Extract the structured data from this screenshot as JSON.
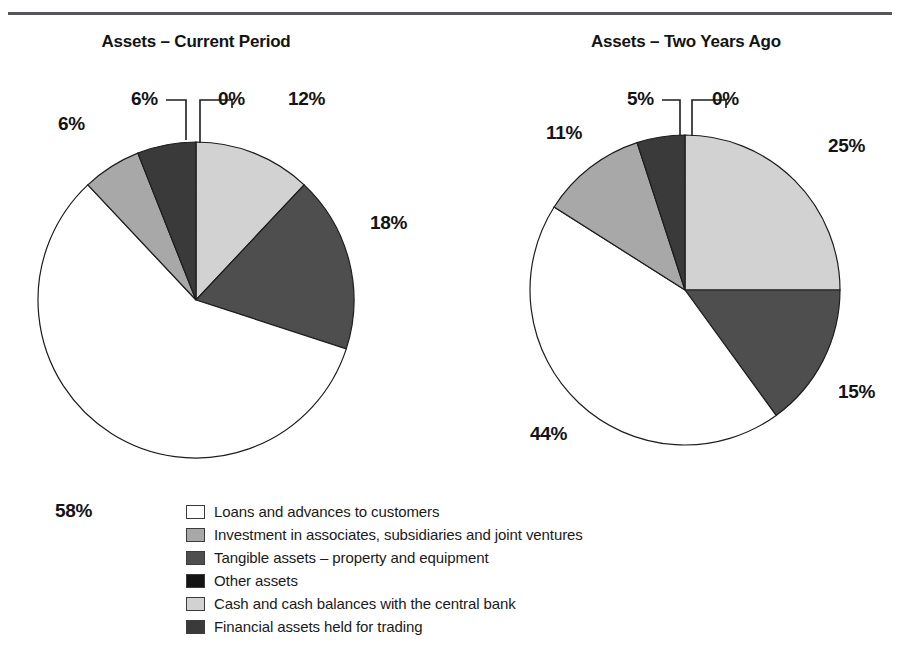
{
  "page": {
    "background_color": "#ffffff",
    "rule_color": "#55565a",
    "text_color": "#141414"
  },
  "chart_data": [
    {
      "type": "pie",
      "title": "Assets – Current Period",
      "labels": [
        "Other assets",
        "Cash and cash balances with the central bank",
        "Tangible assets – property and equipment",
        "Loans and advances to customers",
        "Investment in associates, subsidiaries and joint ventures",
        "Financial assets held for trading"
      ],
      "values": [
        0,
        12,
        18,
        58,
        6,
        6
      ],
      "value_labels": [
        "0%",
        "12%",
        "18%",
        "58%",
        "6%",
        "6%"
      ],
      "colors": [
        "#141414",
        "#d2d2d2",
        "#4e4e4e",
        "#ffffff",
        "#a8a8a8",
        "#3a3a3a"
      ],
      "start_angle_deg": 0,
      "direction": "clockwise",
      "legend_position": "bottom"
    },
    {
      "type": "pie",
      "title": "Assets – Two Years Ago",
      "labels": [
        "Other assets",
        "Cash and cash balances with the central bank",
        "Tangible assets – property and equipment",
        "Loans and advances to customers",
        "Investment in associates, subsidiaries and joint ventures",
        "Financial assets held for trading"
      ],
      "values": [
        0,
        25,
        15,
        44,
        11,
        5
      ],
      "value_labels": [
        "0%",
        "25%",
        "15%",
        "44%",
        "11%",
        "5%"
      ],
      "colors": [
        "#141414",
        "#d2d2d2",
        "#4e4e4e",
        "#ffffff",
        "#a8a8a8",
        "#3a3a3a"
      ],
      "start_angle_deg": 0,
      "direction": "clockwise",
      "legend_position": "bottom"
    }
  ],
  "titles": {
    "left": "Assets – Current Period",
    "right": "Assets – Two Years Ago"
  },
  "pie_left": {
    "cx": 196,
    "cy": 300,
    "r": 158,
    "slices": [
      {
        "name": "other-assets",
        "value": 0,
        "label": "0%",
        "color": "#141414"
      },
      {
        "name": "cash-balances",
        "value": 12,
        "label": "12%",
        "color": "#d2d2d2"
      },
      {
        "name": "tangible-assets",
        "value": 18,
        "label": "18%",
        "color": "#4e4e4e"
      },
      {
        "name": "loans-advances",
        "value": 58,
        "label": "58%",
        "color": "#ffffff"
      },
      {
        "name": "investment-assoc",
        "value": 6,
        "label": "6%",
        "color": "#a8a8a8"
      },
      {
        "name": "financial-assets",
        "value": 6,
        "label": "6%",
        "color": "#3a3a3a"
      }
    ],
    "labels": [
      {
        "name": "slice-label-other-assets",
        "text": "0%",
        "x": 218,
        "y": 88
      },
      {
        "name": "slice-label-cash-balances",
        "text": "12%",
        "x": 288,
        "y": 88
      },
      {
        "name": "slice-label-tangible-assets",
        "text": "18%",
        "x": 370,
        "y": 212
      },
      {
        "name": "slice-label-loans-advances",
        "text": "58%",
        "x": 55,
        "y": 500
      },
      {
        "name": "slice-label-investment-assoc",
        "text": "6%",
        "x": 58,
        "y": 113
      },
      {
        "name": "slice-label-financial-assets",
        "text": "6%",
        "x": 131,
        "y": 88
      }
    ]
  },
  "pie_right": {
    "cx": 685,
    "cy": 290,
    "r": 155,
    "slices": [
      {
        "name": "other-assets",
        "value": 0,
        "label": "0%",
        "color": "#141414"
      },
      {
        "name": "cash-balances",
        "value": 25,
        "label": "25%",
        "color": "#d2d2d2"
      },
      {
        "name": "tangible-assets",
        "value": 15,
        "label": "15%",
        "color": "#4e4e4e"
      },
      {
        "name": "loans-advances",
        "value": 44,
        "label": "44%",
        "color": "#ffffff"
      },
      {
        "name": "investment-assoc",
        "value": 11,
        "label": "11%",
        "color": "#a8a8a8"
      },
      {
        "name": "financial-assets",
        "value": 5,
        "label": "5%",
        "color": "#3a3a3a"
      }
    ],
    "labels": [
      {
        "name": "slice-label-other-assets",
        "text": "0%",
        "x": 712,
        "y": 88
      },
      {
        "name": "slice-label-cash-balances",
        "text": "25%",
        "x": 828,
        "y": 135
      },
      {
        "name": "slice-label-tangible-assets",
        "text": "15%",
        "x": 838,
        "y": 381
      },
      {
        "name": "slice-label-loans-advances",
        "text": "44%",
        "x": 530,
        "y": 423
      },
      {
        "name": "slice-label-investment-assoc",
        "text": "11%",
        "x": 546,
        "y": 122
      },
      {
        "name": "slice-label-financial-assets",
        "text": "5%",
        "x": 627,
        "y": 88
      }
    ]
  },
  "legend": {
    "items": [
      {
        "label": "Loans and advances to customers",
        "color": "#ffffff",
        "name": "legend-item-loans-advances"
      },
      {
        "label": "Investment in associates, subsidiaries and joint ventures",
        "color": "#a8a8a8",
        "name": "legend-item-investment-assoc"
      },
      {
        "label": "Tangible assets – property and equipment",
        "color": "#4e4e4e",
        "name": "legend-item-tangible-assets"
      },
      {
        "label": "Other assets",
        "color": "#141414",
        "name": "legend-item-other-assets"
      },
      {
        "label": "Cash and cash balances with the central bank",
        "color": "#d2d2d2",
        "name": "legend-item-cash-balances"
      },
      {
        "label": "Financial assets held for trading",
        "color": "#3a3a3a",
        "name": "legend-item-financial-assets"
      }
    ]
  }
}
